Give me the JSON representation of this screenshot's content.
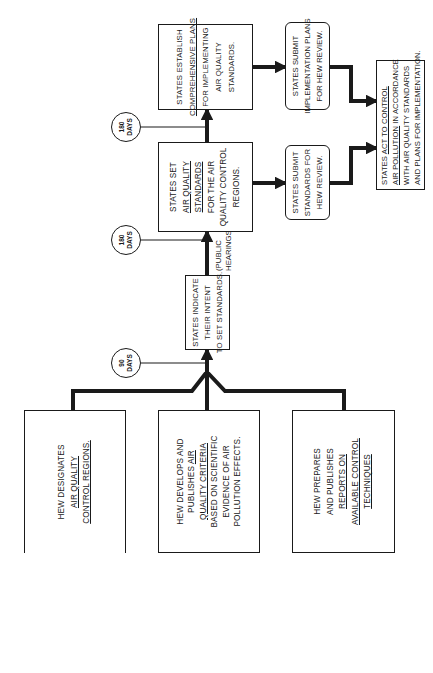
{
  "diagram": {
    "orientation": "rotated 90 degrees counter-clockwise",
    "colors": {
      "ink": "#1a1a1a",
      "background": "#ffffff"
    },
    "hew_boxes": [
      {
        "id": "hew-designates",
        "lines": [
          "HEW DESIGNATES",
          "AIR QUALITY",
          "CONTROL REGIONS."
        ],
        "underlined_lines": [
          1,
          2
        ]
      },
      {
        "id": "hew-criteria",
        "lines": [
          "HEW DEVELOPS AND",
          "PUBLISHES",
          "AIR",
          "QUALITY CRITERIA",
          "BASED ON SCIENTIFIC",
          "EVIDENCE OF AIR",
          "POLLUTION EFFECTS."
        ],
        "display": {
          "l1": "HEW DEVELOPS AND",
          "l2a": "PUBLISHES ",
          "l2b": "AIR",
          "l3": "QUALITY CRITERIA",
          "l4": "BASED ON SCIENTIFIC",
          "l5": "EVIDENCE OF AIR",
          "l6": "POLLUTION EFFECTS."
        }
      },
      {
        "id": "hew-reports",
        "lines": [
          "HEW PREPARES",
          "AND PUBLISHES",
          "REPORTS ON",
          "AVAILABLE CONTROL",
          "TECHNIQUES"
        ],
        "underlined_lines": [
          2,
          3,
          4
        ]
      }
    ],
    "timers": [
      {
        "value": "90",
        "unit": "DAYS"
      },
      {
        "value": "180",
        "unit": "DAYS"
      },
      {
        "value": "180",
        "unit": "DAYS"
      }
    ],
    "states_indicate": {
      "lines": [
        "STATES INDICATE",
        "THEIR INTENT",
        "TO SET STANDARDS."
      ]
    },
    "public_hearings": {
      "lines": [
        "(PUBLIC",
        "HEARINGS)"
      ]
    },
    "states_set": {
      "lines": [
        "STATES SET",
        "AIR QUALITY",
        "STANDARDS",
        "FOR THE AIR",
        "QUALITY CONTROL",
        "REGIONS."
      ],
      "underlined_lines": [
        1,
        2
      ]
    },
    "states_establish": {
      "lines": [
        "STATES ESTABLISH",
        "COMPREHENSIVE PLANS",
        "FOR IMPLEMENTING",
        "AIR QUALITY",
        "STANDARDS."
      ],
      "underlined_lines": [
        1
      ]
    },
    "submit_standards": {
      "lines": [
        "STATES SUBMIT",
        "STANDARDS FOR",
        "HEW REVIEW."
      ]
    },
    "submit_plans": {
      "lines": [
        "STATES SUBMIT",
        "IMPLEMENTATION PLANS",
        "FOR HEW REVIEW."
      ]
    },
    "act_to_control": {
      "lines": [
        "STATES ACT TO CONTROL",
        "AIR POLLUTION IN ACCORDANCE",
        "WITH AIR QUALITY STANDARDS",
        "AND PLANS FOR IMPLEMENTATION."
      ],
      "display": {
        "l1a": "STATES ",
        "l1b": "ACT TO CONTROL",
        "l2a": "AIR POLLUTION",
        "l2b": " IN ACCORDANCE",
        "l3": "WITH AIR QUALITY STANDARDS",
        "l4": "AND PLANS FOR IMPLEMENTATION."
      }
    }
  }
}
